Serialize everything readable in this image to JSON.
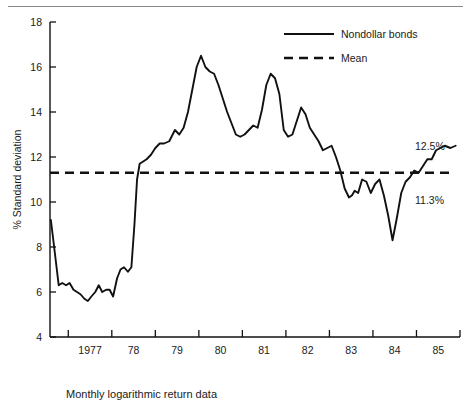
{
  "figure": {
    "caption": "Monthly logarithmic return data",
    "top_rule": "horizontal-rule",
    "line_color": "#111111",
    "axis_color": "#111111",
    "background": "#ffffff"
  },
  "legend": {
    "position": "top-right",
    "entries": [
      {
        "label": "Nondollar bonds",
        "style": "solid"
      },
      {
        "label": "Mean",
        "style": "dashed"
      }
    ]
  },
  "annotations": {
    "end_value": "12.5%",
    "mean_value": "11.3%"
  },
  "axes": {
    "y_title": "% Standard deviation",
    "y_ticks": [
      "18",
      "16",
      "14",
      "12",
      "10",
      "8",
      "6",
      "4"
    ],
    "x_ticks": [
      "1977",
      "78",
      "79",
      "80",
      "81",
      "82",
      "83",
      "84",
      "85"
    ]
  },
  "chart_data": {
    "type": "line",
    "title": "",
    "xlabel": "Monthly logarithmic return data",
    "ylabel": "% Standard deviation",
    "xlim": [
      1976.58,
      1986.0
    ],
    "ylim": [
      4,
      18
    ],
    "y_ticks": [
      4,
      6,
      8,
      10,
      12,
      14,
      16,
      18
    ],
    "x_tick_values": [
      1977,
      1978,
      1979,
      1980,
      1981,
      1982,
      1983,
      1984,
      1985
    ],
    "x_tick_labels": [
      "1977",
      "78",
      "79",
      "80",
      "81",
      "82",
      "83",
      "84",
      "85"
    ],
    "grid": false,
    "legend_position": "top-right",
    "series": [
      {
        "name": "Nondollar bonds",
        "style": "solid",
        "color": "#111111",
        "x": [
          1976.6,
          1976.7,
          1976.78,
          1976.86,
          1976.95,
          1977.03,
          1977.12,
          1977.2,
          1977.28,
          1977.37,
          1977.45,
          1977.53,
          1977.62,
          1977.7,
          1977.78,
          1977.87,
          1977.95,
          1978.03,
          1978.12,
          1978.2,
          1978.28,
          1978.37,
          1978.45,
          1978.52,
          1978.58,
          1978.64,
          1978.72,
          1978.8,
          1978.9,
          1979.0,
          1979.1,
          1979.2,
          1979.32,
          1979.45,
          1979.55,
          1979.65,
          1979.75,
          1979.85,
          1979.95,
          1980.05,
          1980.15,
          1980.25,
          1980.35,
          1980.45,
          1980.55,
          1980.65,
          1980.75,
          1980.85,
          1980.95,
          1981.05,
          1981.15,
          1981.25,
          1981.35,
          1981.45,
          1981.55,
          1981.65,
          1981.75,
          1981.85,
          1981.95,
          1982.05,
          1982.15,
          1982.25,
          1982.35,
          1982.45,
          1982.55,
          1982.65,
          1982.75,
          1982.85,
          1982.95,
          1983.05,
          1983.15,
          1983.25,
          1983.35,
          1983.45,
          1983.52,
          1983.58,
          1983.66,
          1983.75,
          1983.85,
          1983.95,
          1984.05,
          1984.15,
          1984.25,
          1984.35,
          1984.45,
          1984.55,
          1984.65,
          1984.75,
          1984.85,
          1984.95,
          1985.05,
          1985.15,
          1985.25,
          1985.35,
          1985.45,
          1985.55,
          1985.65,
          1985.78,
          1985.9
        ],
        "y": [
          9.2,
          7.6,
          6.3,
          6.4,
          6.3,
          6.4,
          6.1,
          6.0,
          5.9,
          5.7,
          5.6,
          5.8,
          6.0,
          6.3,
          6.0,
          6.1,
          6.1,
          5.8,
          6.6,
          7.0,
          7.1,
          6.9,
          7.1,
          9.0,
          11.0,
          11.7,
          11.8,
          11.9,
          12.1,
          12.4,
          12.6,
          12.6,
          12.7,
          13.2,
          13.0,
          13.3,
          14.0,
          15.0,
          16.0,
          16.5,
          16.0,
          15.8,
          15.7,
          15.2,
          14.6,
          14.0,
          13.5,
          13.0,
          12.9,
          13.0,
          13.2,
          13.4,
          13.3,
          14.1,
          15.2,
          15.7,
          15.5,
          14.8,
          13.2,
          12.9,
          13.0,
          13.6,
          14.2,
          13.9,
          13.3,
          13.0,
          12.7,
          12.3,
          12.4,
          12.5,
          12.0,
          11.4,
          10.6,
          10.2,
          10.3,
          10.5,
          10.4,
          11.0,
          10.9,
          10.4,
          10.8,
          11.0,
          10.3,
          9.4,
          8.3,
          9.3,
          10.4,
          10.9,
          11.1,
          11.4,
          11.3,
          11.6,
          11.9,
          11.9,
          12.3,
          12.4,
          12.5,
          12.4,
          12.5
        ]
      },
      {
        "name": "Mean",
        "style": "dashed",
        "color": "#111111",
        "constant_y": 11.3
      }
    ]
  }
}
